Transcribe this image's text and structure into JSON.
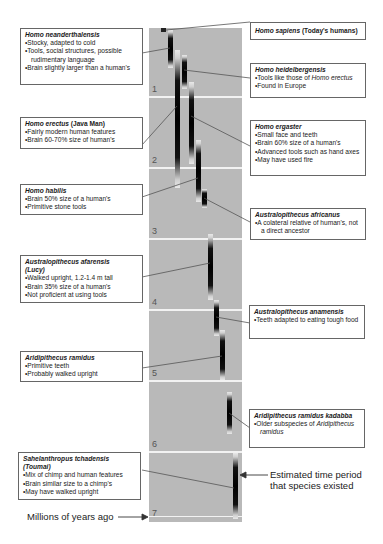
{
  "axis": {
    "label": "Millions of years ago",
    "ticks": [
      "1",
      "2",
      "3",
      "4",
      "5",
      "6",
      "7"
    ]
  },
  "legend_note": "Estimated time period that species existed",
  "species": {
    "sapiens": {
      "name": "Homo sapiens",
      "suffix": "(Today's humans)",
      "bullets": []
    },
    "neanderthalensis": {
      "name": "Homo neanderthalensis",
      "bullets": [
        "Stocky, adapted to cold",
        "Tools, social structures, possible rudimentary language",
        "Brain slightly larger than a human's"
      ]
    },
    "heidelbergensis": {
      "name": "Homo heidelbergensis",
      "bullets_pre": "Tools like those of ",
      "bullets_em": "Homo erectus",
      "bullets": [
        "Found in Europe"
      ]
    },
    "erectus": {
      "name": "Homo erectus",
      "suffix": "(Java Man)",
      "bullets": [
        "Fairly modern human features",
        "Brain 60-70% size of human's"
      ]
    },
    "ergaster": {
      "name": "Homo ergaster",
      "bullets": [
        "Small face and teeth",
        "Brain 60% size of a human's",
        "Advanced tools such as hand axes",
        "May have used fire"
      ]
    },
    "habilis": {
      "name": "Homo habilis",
      "bullets": [
        "Brain 50% size of a human's",
        "Primitive stone tools"
      ]
    },
    "africanus": {
      "name": "Australopithecus africanus",
      "bullets": [
        "A colateral relative of human's, not a direct ancestor"
      ]
    },
    "afarensis": {
      "name": "Australopithecus afarensis",
      "suffix": "(Lucy)",
      "bullets": [
        "Walked upright, 1.2-1.4 m tall",
        "Brain 35% size of a human's",
        "Not proficient at using tools"
      ]
    },
    "anamensis": {
      "name": "Australopithecus anamensis",
      "bullets": [
        "Teeth adapted to eating tough food"
      ]
    },
    "ramidus": {
      "name": "Aridipithecus ramidus",
      "bullets": [
        "Primitive teeth",
        "Probably walked upright"
      ]
    },
    "kadabba": {
      "name": "Aridipithecus ramidus kadabba",
      "bullet_pre": "Older subspecies of ",
      "bullet_em": "Aridipithecus ramidus"
    },
    "sahelanthropus": {
      "name": "Sahelanthropus tchadensis",
      "suffix": "(Toumai)",
      "bullets": [
        "Mix of chimp and human features",
        "Brain similar size to a chimp's",
        "May have walked upright"
      ]
    }
  },
  "colors": {
    "panel": "#b9b9b9",
    "separator": "#f2f2f2",
    "bar": "#000000",
    "box_border": "#666666"
  }
}
